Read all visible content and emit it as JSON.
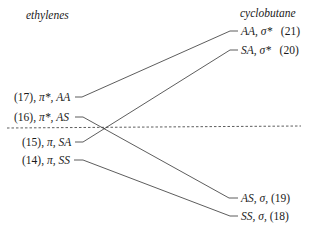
{
  "headers": {
    "left": "ethylenes",
    "right": "cyclobutane"
  },
  "left_levels": [
    {
      "num": "(17),",
      "orb": "π*,",
      "sym": "AA"
    },
    {
      "num": "(16),",
      "orb": "π*,",
      "sym": "AS"
    },
    {
      "num": "(15),",
      "orb": "π,",
      "sym": "SA"
    },
    {
      "num": "(14),",
      "orb": "π,",
      "sym": "SS"
    }
  ],
  "right_levels": [
    {
      "sym": "AA,",
      "orb": "σ*",
      "num": "(21)"
    },
    {
      "sym": "SA,",
      "orb": "σ*",
      "num": "(20)"
    },
    {
      "sym": "AS,",
      "orb": "σ,",
      "num": "(19)"
    },
    {
      "sym": "SS,",
      "orb": "σ,",
      "num": "(18)"
    }
  ],
  "correlations": [
    {
      "from": "AA (17)",
      "to": "AA (21)"
    },
    {
      "from": "AS (16)",
      "to": "AS (19)"
    },
    {
      "from": "SA (15)",
      "to": "SA (20)"
    },
    {
      "from": "SS (14)",
      "to": "SS (18)"
    }
  ],
  "divider": "dashed"
}
